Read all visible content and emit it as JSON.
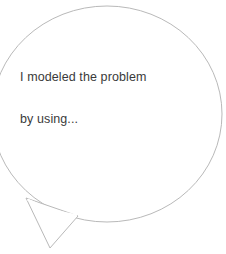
{
  "canvas": {
    "width": 226,
    "height": 254,
    "background_color": "#ffffff"
  },
  "speech_bubble": {
    "shape": "ellipse-with-pointed-tail",
    "outline_color": "#b9b9b9",
    "fill_color": "#ffffff",
    "stroke_width": 1,
    "ellipse": {
      "center_x": 107,
      "center_y": 114,
      "radius_x": 115,
      "radius_y": 108
    },
    "tail": {
      "direction": "down-left",
      "point_1_x": 26,
      "point_1_y": 198,
      "apex_x": 50,
      "apex_y": 248,
      "point_2_x": 78,
      "point_2_y": 216
    },
    "text": {
      "line_1": "I modeled the problem",
      "line_2": "by using...",
      "full": "I modeled the problem by using...",
      "color": "#3a3a3a",
      "align": "left"
    }
  }
}
